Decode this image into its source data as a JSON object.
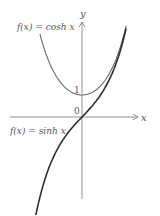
{
  "chart_data": {
    "type": "line",
    "title": "",
    "xlabel": "x",
    "ylabel": "y",
    "origin_label": "0",
    "tick_labels_y": [
      "1"
    ],
    "grid": false,
    "series": [
      {
        "name": "f(x) = cosh x",
        "label": "f(x) = cosh x",
        "color": "#666666",
        "x": [
          -2.0,
          -1.5,
          -1.0,
          -0.5,
          0,
          0.5,
          1.0,
          1.5,
          2.0,
          2.1
        ],
        "values": [
          3.76,
          2.35,
          1.54,
          1.13,
          1.0,
          1.13,
          1.54,
          2.35,
          3.76,
          4.14
        ]
      },
      {
        "name": "f(x) = sinh x",
        "label": "f(x) = sinh x",
        "color": "#333333",
        "x": [
          -2.2,
          -2.0,
          -1.5,
          -1.0,
          -0.5,
          0,
          0.5,
          1.0,
          1.5,
          2.0,
          2.1
        ],
        "values": [
          -4.46,
          -3.63,
          -2.13,
          -1.18,
          -0.52,
          0,
          0.52,
          1.18,
          2.13,
          3.63,
          4.02
        ]
      }
    ],
    "xlim": [
      -2.3,
      2.6
    ],
    "ylim": [
      -4.5,
      4.8
    ],
    "annotations": [
      "1",
      "0"
    ]
  },
  "labels": {
    "cosh": "f(x) = cosh x",
    "sinh": "f(x) = sinh x",
    "x_axis": "x",
    "y_axis": "y",
    "one": "1",
    "zero": "0"
  }
}
